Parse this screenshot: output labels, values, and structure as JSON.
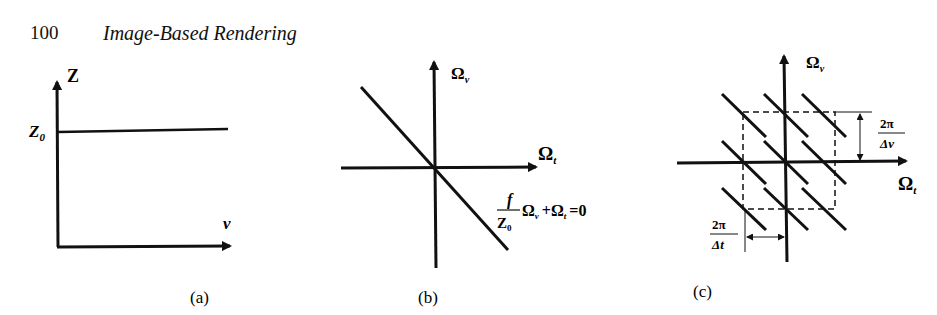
{
  "header": {
    "page_number": "100",
    "running_title": "Image-Based Rendering"
  },
  "figures": {
    "a": {
      "caption": "(a)",
      "y_axis_label": "Z",
      "x_axis_label": "v",
      "level_label": "Z",
      "level_subscript": "0"
    },
    "b": {
      "caption": "(b)",
      "y_axis_label": "Ω",
      "y_axis_sub": "v",
      "x_axis_label": "Ω",
      "x_axis_sub": "t",
      "eq_numerator": "f",
      "eq_denominator": "Z",
      "eq_denominator_sub": "0",
      "eq_rest_1": "Ω",
      "eq_rest_1_sub": "v",
      "eq_rest_2": "+Ω",
      "eq_rest_2_sub": "t",
      "eq_rest_3": "=0"
    },
    "c": {
      "caption": "(c)",
      "y_axis_label": "Ω",
      "y_axis_sub": "v",
      "x_axis_label": "Ω",
      "x_axis_sub": "t",
      "dv_numerator": "2π",
      "dv_denominator": "Δv",
      "dt_numerator": "2π",
      "dt_denominator": "Δt"
    }
  }
}
